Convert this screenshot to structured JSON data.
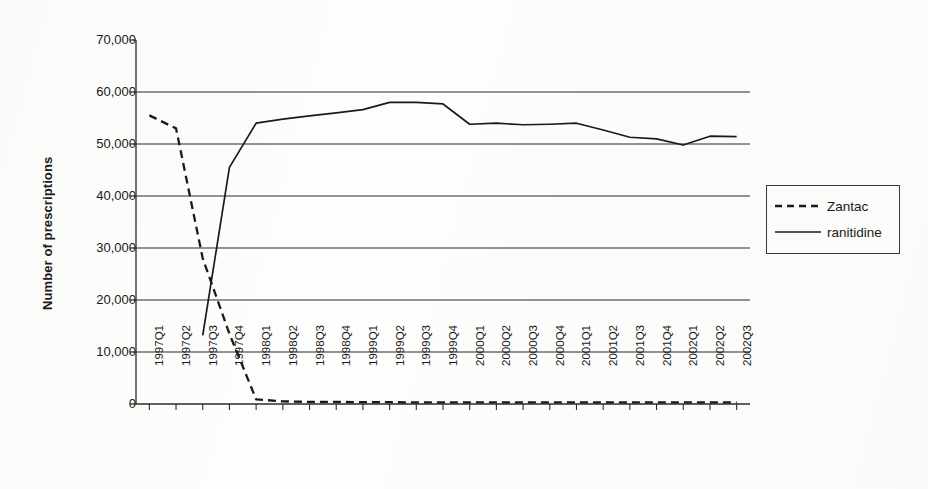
{
  "chart_data": {
    "type": "line",
    "title": "",
    "xlabel": "",
    "ylabel": "Number of prescriptions",
    "ylim": [
      0,
      70000
    ],
    "grid": true,
    "legend_position": "right",
    "y_ticks": [
      "0",
      "10,000",
      "20,000",
      "30,000",
      "40,000",
      "50,000",
      "60,000",
      "70,000"
    ],
    "y_tick_values": [
      0,
      10000,
      20000,
      30000,
      40000,
      50000,
      60000,
      70000
    ],
    "categories": [
      "1997Q1",
      "1997Q2",
      "1997Q3",
      "1997Q4",
      "1998Q1",
      "1998Q2",
      "1998Q3",
      "1998Q4",
      "1999Q1",
      "1999Q2",
      "1999Q3",
      "1999Q4",
      "2000Q1",
      "2000Q2",
      "2000Q3",
      "2000Q4",
      "2001Q1",
      "2001Q2",
      "2001Q3",
      "2001Q4",
      "2002Q1",
      "2002Q2",
      "2002Q3"
    ],
    "series": [
      {
        "name": "Zantac",
        "style": "dashed",
        "color": "#1a1a1a",
        "values": [
          55500,
          53000,
          28000,
          13500,
          900,
          500,
          400,
          400,
          350,
          350,
          300,
          300,
          300,
          300,
          300,
          300,
          300,
          300,
          300,
          300,
          300,
          300,
          300
        ]
      },
      {
        "name": "ranitidine",
        "style": "solid",
        "color": "#1a1a1a",
        "values": [
          null,
          null,
          13200,
          45500,
          54000,
          54800,
          55400,
          56000,
          56600,
          58000,
          58000,
          57700,
          53800,
          54000,
          53700,
          53800,
          54000,
          52700,
          51300,
          51000,
          49800,
          51500,
          51400
        ]
      }
    ]
  },
  "legend": {
    "items": [
      {
        "label": "Zantac",
        "style": "dashed"
      },
      {
        "label": "ranitidine",
        "style": "solid"
      }
    ]
  }
}
